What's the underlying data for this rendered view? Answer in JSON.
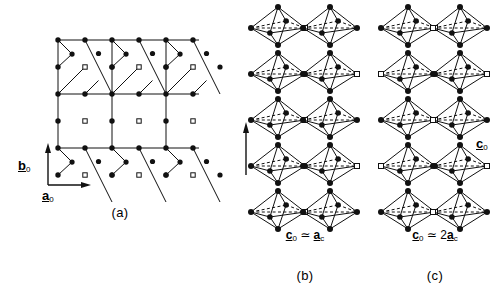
{
  "figure": {
    "type": "crystal-structure-diagram",
    "background": "#ffffff",
    "ink": "#000000"
  },
  "panels": [
    {
      "id": "a",
      "caption": "(a)",
      "kind": "plane-projection"
    },
    {
      "id": "b",
      "caption": "(b)",
      "kind": "octahedra-chain",
      "relation": {
        "lhs_vec": "c",
        "lhs_sub": "0",
        "op": "≃",
        "coef": "",
        "rhs_vec": "a",
        "rhs_sub": "c"
      }
    },
    {
      "id": "c",
      "caption": "(c)",
      "kind": "octahedra-chain",
      "relation": {
        "lhs_vec": "c",
        "lhs_sub": "0",
        "op": "≃",
        "coef": "2",
        "rhs_vec": "a",
        "rhs_sub": "c"
      }
    }
  ],
  "axes": [
    {
      "name": "b-axis",
      "vec": "b",
      "sub": "0",
      "direction": "up",
      "panel": "a"
    },
    {
      "name": "a-axis",
      "vec": "a",
      "sub": "0",
      "direction": "right",
      "panel": "a"
    },
    {
      "name": "c-axis",
      "vec": "c",
      "sub": "0",
      "direction": "up",
      "panel": "b"
    }
  ],
  "legend": {
    "filled_circle": "occupied atom site",
    "open_square": "vacancy site"
  },
  "chart_data": {
    "type": "scatter",
    "title": "",
    "xlabel": "a0",
    "ylabel": "b0",
    "grid": false,
    "panel_a": {
      "lattice_step_x": 27,
      "lattice_step_y": 27,
      "rows_y": [
        40,
        67,
        94,
        121,
        148,
        175
      ],
      "cols_x": [
        58,
        85,
        112,
        139,
        166,
        193
      ],
      "filled_site_count": 38,
      "vacancy_site_count": 9
    },
    "panel_b": {
      "octahedra_rows": 5,
      "octahedra_columns": 2,
      "period_label": "c0 = ac"
    },
    "panel_c": {
      "octahedra_rows": 5,
      "octahedra_columns": 2,
      "period_label": "c0 = 2ac"
    }
  }
}
